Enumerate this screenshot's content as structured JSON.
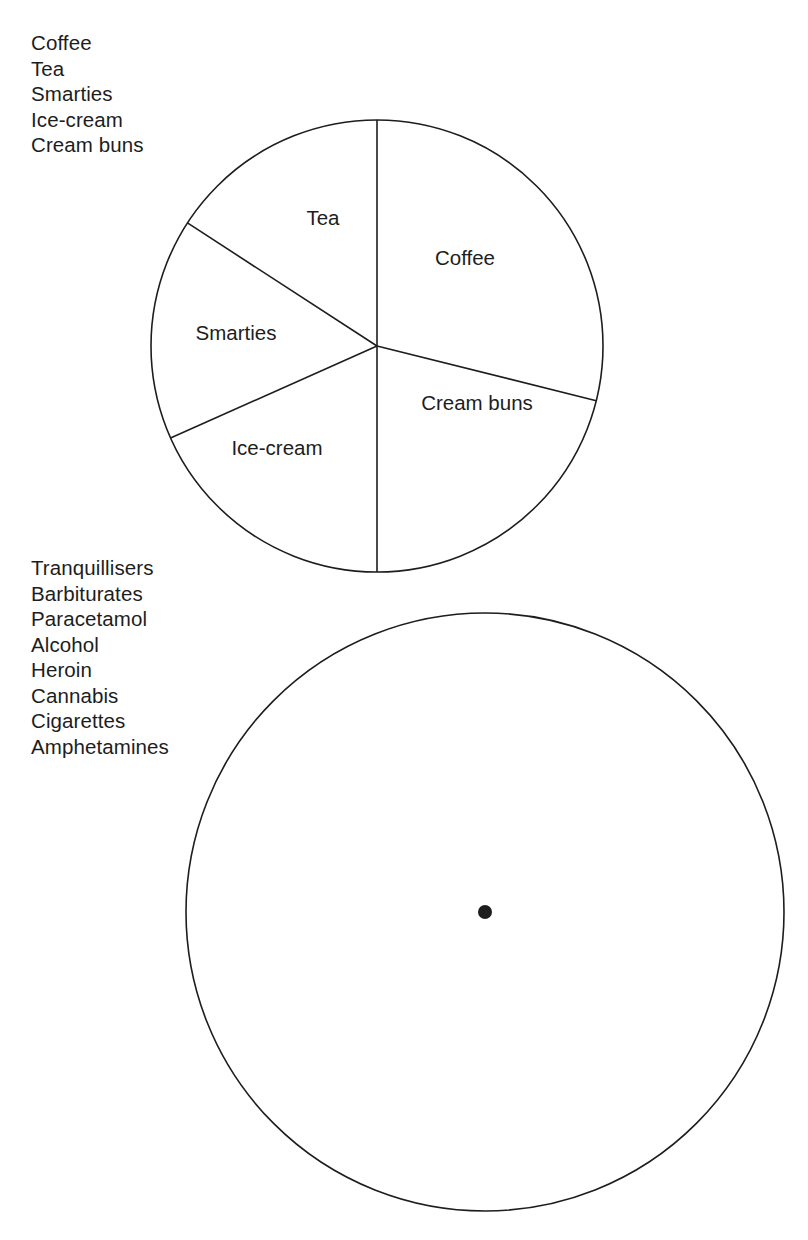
{
  "page": {
    "background_color": "#ffffff",
    "ink_color": "#1d1d1a"
  },
  "key_lists": [
    {
      "name": "drinks-and-treats-key",
      "items": [
        "Coffee",
        "Tea",
        "Smarties",
        "Ice-cream",
        "Cream buns"
      ]
    },
    {
      "name": "drugs-key",
      "items": [
        "Tranquillisers",
        "Barbiturates",
        "Paracetamol",
        "Alcohol",
        "Heroin",
        "Cannabis",
        "Cigarettes",
        "Amphetamines"
      ]
    }
  ],
  "chart_data": [
    {
      "type": "pie",
      "name": "drinks-and-treats-pie",
      "title": "",
      "center": [
        377,
        346
      ],
      "radius": 226,
      "start_angle_deg": 0,
      "direction": "clockwise",
      "legend_position": "above-left",
      "labels_inside": true,
      "categories": [
        "Coffee",
        "Cream buns",
        "Ice-cream",
        "Smarties",
        "Tea"
      ],
      "angles_deg": [
        104,
        76,
        66,
        57,
        57
      ],
      "values_percent": [
        28.9,
        21.1,
        18.3,
        15.8,
        15.8
      ],
      "label_positions": [
        {
          "label": "Coffee",
          "x": 465,
          "y": 260
        },
        {
          "label": "Cream buns",
          "x": 477,
          "y": 405
        },
        {
          "label": "Ice-cream",
          "x": 277,
          "y": 450
        },
        {
          "label": "Smarties",
          "x": 236,
          "y": 335
        },
        {
          "label": "Tea",
          "x": 323,
          "y": 220
        }
      ]
    },
    {
      "type": "pie",
      "name": "drugs-pie-blank",
      "title": "",
      "center": [
        485,
        912
      ],
      "radius": 299,
      "start_angle_deg": 0,
      "direction": "clockwise",
      "legend_position": "above-left",
      "labels_inside": false,
      "categories": [],
      "angles_deg": [],
      "values_percent": [],
      "label_positions": [],
      "note": "empty circle with centre dot only"
    }
  ]
}
